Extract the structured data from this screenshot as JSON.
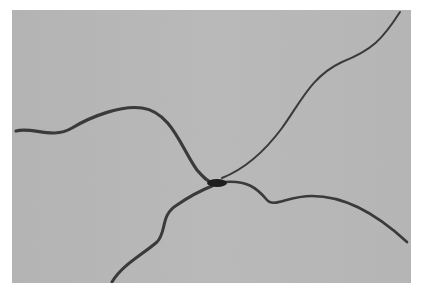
{
  "image": {
    "description": "Grayscale micrograph of four dark filamentous strands radiating from a central junction",
    "colors": {
      "page_background": "#ffffff",
      "panel_background": "#b7b7b7",
      "strand": "#3a3a3a",
      "junction": "#1e1e1e"
    },
    "strands": [
      {
        "name": "left-strand",
        "path": "M 4 121 C 20 116, 40 130, 60 118 C 80 106, 110 95, 130 98 C 160 102, 170 140, 185 160 C 192 168, 196 172, 200 172"
      },
      {
        "name": "upper-right-strand",
        "path": "M 388 2 C 370 30, 360 40, 330 52 C 300 66, 290 90, 270 118 C 250 145, 230 160, 210 168"
      },
      {
        "name": "lower-left-strand",
        "path": "M 100 272 C 110 255, 130 245, 145 232 C 155 222, 148 205, 165 195 C 178 186, 190 180, 200 176"
      },
      {
        "name": "lower-right-strand",
        "path": "M 212 172 C 235 170, 245 178, 255 190 C 262 198, 275 186, 300 186 C 330 186, 360 200, 395 232"
      }
    ]
  }
}
